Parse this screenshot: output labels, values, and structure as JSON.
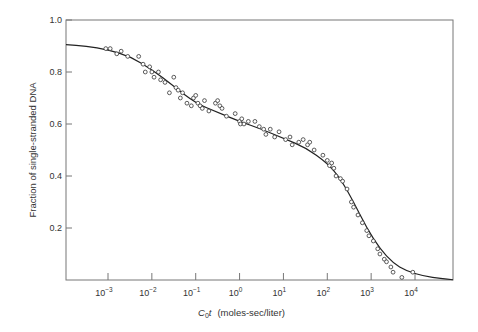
{
  "chart_data": {
    "type": "scatter",
    "title": "",
    "xlabel_main": "C",
    "xlabel_sub": "0",
    "xlabel_var": "t",
    "xlabel_units": "(moles-sec/liter)",
    "ylabel": "Fraction of single-stranded DNA",
    "xscale": "log",
    "xlim_log10": [
      -4.0,
      5.0
    ],
    "ylim": [
      0,
      1.0
    ],
    "yticks": [
      {
        "value": 0.2,
        "label": "0.2"
      },
      {
        "value": 0.4,
        "label": "0.4"
      },
      {
        "value": 0.6,
        "label": "0.6"
      },
      {
        "value": 0.8,
        "label": "0.8"
      },
      {
        "value": 1.0,
        "label": "1.0"
      }
    ],
    "xticks": [
      {
        "exp": -3,
        "base": "10",
        "sup": "−3"
      },
      {
        "exp": -2,
        "base": "10",
        "sup": "−2"
      },
      {
        "exp": -1,
        "base": "10",
        "sup": "−1"
      },
      {
        "exp": 0,
        "base": "10",
        "sup": "0"
      },
      {
        "exp": 1,
        "base": "10",
        "sup": "1"
      },
      {
        "exp": 2,
        "base": "10",
        "sup": "2"
      },
      {
        "exp": 3,
        "base": "10",
        "sup": "3"
      },
      {
        "exp": 4,
        "base": "10",
        "sup": "4"
      }
    ],
    "grid": false,
    "legend": null,
    "series": [
      {
        "name": "observed",
        "style": "open-circle",
        "points_log10x_y": [
          [
            -3.05,
            0.89
          ],
          [
            -2.95,
            0.89
          ],
          [
            -2.8,
            0.87
          ],
          [
            -2.7,
            0.88
          ],
          [
            -2.55,
            0.86
          ],
          [
            -2.3,
            0.86
          ],
          [
            -2.2,
            0.83
          ],
          [
            -2.15,
            0.8
          ],
          [
            -2.05,
            0.82
          ],
          [
            -2.0,
            0.8
          ],
          [
            -1.95,
            0.78
          ],
          [
            -1.85,
            0.8
          ],
          [
            -1.8,
            0.77
          ],
          [
            -1.7,
            0.76
          ],
          [
            -1.6,
            0.72
          ],
          [
            -1.5,
            0.78
          ],
          [
            -1.45,
            0.74
          ],
          [
            -1.4,
            0.73
          ],
          [
            -1.35,
            0.7
          ],
          [
            -1.3,
            0.72
          ],
          [
            -1.2,
            0.68
          ],
          [
            -1.1,
            0.67
          ],
          [
            -1.05,
            0.7
          ],
          [
            -1.0,
            0.71
          ],
          [
            -0.95,
            0.68
          ],
          [
            -0.9,
            0.67
          ],
          [
            -0.85,
            0.66
          ],
          [
            -0.8,
            0.69
          ],
          [
            -0.7,
            0.65
          ],
          [
            -0.55,
            0.68
          ],
          [
            -0.5,
            0.69
          ],
          [
            -0.45,
            0.67
          ],
          [
            -0.4,
            0.66
          ],
          [
            -0.3,
            0.63
          ],
          [
            -0.1,
            0.64
          ],
          [
            0.0,
            0.61
          ],
          [
            0.02,
            0.6
          ],
          [
            0.05,
            0.62
          ],
          [
            0.1,
            0.6
          ],
          [
            0.2,
            0.61
          ],
          [
            0.35,
            0.61
          ],
          [
            0.45,
            0.59
          ],
          [
            0.55,
            0.58
          ],
          [
            0.6,
            0.56
          ],
          [
            0.7,
            0.58
          ],
          [
            0.8,
            0.55
          ],
          [
            0.9,
            0.57
          ],
          [
            1.05,
            0.54
          ],
          [
            1.15,
            0.55
          ],
          [
            1.2,
            0.52
          ],
          [
            1.35,
            0.53
          ],
          [
            1.45,
            0.54
          ],
          [
            1.55,
            0.52
          ],
          [
            1.6,
            0.53
          ],
          [
            1.7,
            0.5
          ],
          [
            1.9,
            0.48
          ],
          [
            2.0,
            0.46
          ],
          [
            2.05,
            0.44
          ],
          [
            2.1,
            0.45
          ],
          [
            2.15,
            0.43
          ],
          [
            2.2,
            0.4
          ],
          [
            2.3,
            0.39
          ],
          [
            2.35,
            0.38
          ],
          [
            2.45,
            0.35
          ],
          [
            2.55,
            0.3
          ],
          [
            2.6,
            0.28
          ],
          [
            2.7,
            0.25
          ],
          [
            2.8,
            0.22
          ],
          [
            2.9,
            0.19
          ],
          [
            2.95,
            0.17
          ],
          [
            3.05,
            0.15
          ],
          [
            3.15,
            0.12
          ],
          [
            3.2,
            0.1
          ],
          [
            3.3,
            0.08
          ],
          [
            3.35,
            0.07
          ],
          [
            3.45,
            0.05
          ],
          [
            3.5,
            0.03
          ],
          [
            3.7,
            0.01
          ],
          [
            3.95,
            0.03
          ]
        ]
      },
      {
        "name": "fitted curve",
        "style": "line",
        "points_log10x_y": [
          [
            -4.0,
            0.905
          ],
          [
            -3.5,
            0.9
          ],
          [
            -3.0,
            0.885
          ],
          [
            -2.5,
            0.86
          ],
          [
            -2.0,
            0.81
          ],
          [
            -1.5,
            0.745
          ],
          [
            -1.0,
            0.68
          ],
          [
            -0.5,
            0.645
          ],
          [
            0.0,
            0.61
          ],
          [
            0.5,
            0.58
          ],
          [
            1.0,
            0.545
          ],
          [
            1.5,
            0.51
          ],
          [
            2.0,
            0.45
          ],
          [
            2.3,
            0.39
          ],
          [
            2.6,
            0.3
          ],
          [
            2.9,
            0.2
          ],
          [
            3.2,
            0.12
          ],
          [
            3.5,
            0.065
          ],
          [
            3.8,
            0.035
          ],
          [
            4.2,
            0.015
          ],
          [
            4.6,
            0.005
          ],
          [
            5.0,
            0.001
          ]
        ]
      }
    ]
  }
}
